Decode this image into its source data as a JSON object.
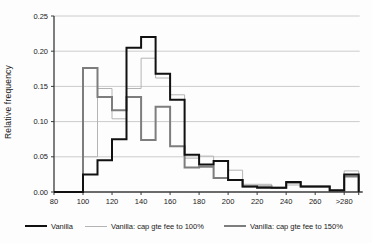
{
  "chart_data": {
    "type": "line",
    "style": "step-histogram",
    "title": "",
    "xlabel": "",
    "ylabel": "Relative frequency",
    "ylim": [
      0,
      0.25
    ],
    "grid": "horizontal",
    "legend_position": "bottom",
    "y_tick_labels": [
      "0.00",
      "0.05",
      "0.10",
      "0.15",
      "0.20",
      "0.25"
    ],
    "y_tick_values": [
      0,
      0.05,
      0.1,
      0.15,
      0.2,
      0.25
    ],
    "x_tick_labels": [
      "80",
      "100",
      "120",
      "140",
      "160",
      "180",
      "200",
      "220",
      "240",
      "260",
      ">280"
    ],
    "categories": [
      "80-90",
      "90-100",
      "100-110",
      "110-120",
      "120-130",
      "130-140",
      "140-150",
      "150-160",
      "160-170",
      "170-180",
      "180-190",
      "190-200",
      "200-210",
      "210-220",
      "220-230",
      "230-240",
      "240-250",
      "250-260",
      "260-270",
      "270-280",
      ">280"
    ],
    "series": [
      {
        "name": "Vanilla: cap gte fee to 100%",
        "color": "#b4b4b4",
        "line_width": 1,
        "values": [
          0,
          0,
          0.05,
          0.147,
          0.104,
          0.147,
          0.19,
          0.162,
          0.138,
          0.048,
          0.051,
          0.02,
          0.031,
          0.011,
          0.011,
          0.005,
          0.01,
          0.007,
          0.007,
          0.002,
          0.03
        ]
      },
      {
        "name": "Vanilla: cap gte fee to 150%",
        "color": "#7d7d7d",
        "line_width": 2,
        "values": [
          0,
          0,
          0.176,
          0.135,
          0.116,
          0.135,
          0.074,
          0.121,
          0.065,
          0.035,
          0.036,
          0.02,
          0.017,
          0.008,
          0.008,
          0.006,
          0.013,
          0.008,
          0.008,
          0.003,
          0.022
        ]
      },
      {
        "name": "Vanilla",
        "color": "#111111",
        "line_width": 2,
        "values": [
          0,
          0,
          0.025,
          0.045,
          0.075,
          0.205,
          0.22,
          0.168,
          0.131,
          0.053,
          0.039,
          0.044,
          0.017,
          0.008,
          0.006,
          0.006,
          0.014,
          0.008,
          0.008,
          0.002,
          0.025
        ]
      }
    ],
    "legend_order": [
      "Vanilla",
      "Vanilla: cap gte fee to 100%",
      "Vanilla: cap gte fee to 150%"
    ],
    "axis_color": "#3a3a3a",
    "grid_color": "#cccccc",
    "text_color": "#1a1a1a"
  }
}
